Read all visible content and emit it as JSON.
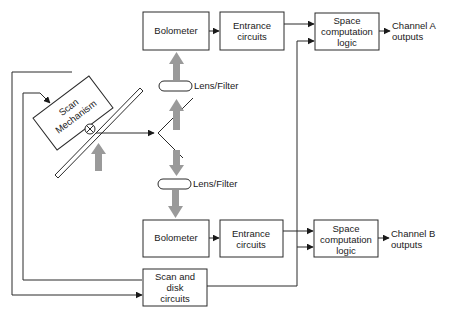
{
  "diagram": {
    "type": "block-diagram",
    "nodes": {
      "bolometer_a": {
        "label": "Bolometer"
      },
      "entrance_a": {
        "line1": "Entrance",
        "line2": "circuits"
      },
      "space_a": {
        "line1": "Space",
        "line2": "computation",
        "line3": "logic"
      },
      "output_a": {
        "line1": "Channel A",
        "line2": "outputs"
      },
      "bolometer_b": {
        "label": "Bolometer"
      },
      "entrance_b": {
        "line1": "Entrance",
        "line2": "circuits"
      },
      "space_b": {
        "line1": "Space",
        "line2": "computation",
        "line3": "logic"
      },
      "output_b": {
        "line1": "Channel B",
        "line2": "outputs"
      },
      "scan_mechanism": {
        "line1": "Scan",
        "line2": "Mechanism"
      },
      "scan_disk": {
        "line1": "Scan and",
        "line2": "disk",
        "line3": "circuits"
      },
      "lens_top": {
        "label": "Lens/Filter"
      },
      "lens_bottom": {
        "label": "Lens/Filter"
      }
    },
    "edges": [
      {
        "from": "bolometer_a",
        "to": "entrance_a"
      },
      {
        "from": "entrance_a",
        "to": "space_a"
      },
      {
        "from": "scan_disk",
        "to": "space_a"
      },
      {
        "from": "space_a",
        "to": "output_a"
      },
      {
        "from": "bolometer_b",
        "to": "entrance_b"
      },
      {
        "from": "entrance_b",
        "to": "space_b"
      },
      {
        "from": "scan_disk",
        "to": "space_b"
      },
      {
        "from": "space_b",
        "to": "output_b"
      },
      {
        "from": "scan_disk",
        "to": "scan_mechanism"
      },
      {
        "from": "scan_mechanism",
        "to": "scan_disk"
      },
      {
        "from": "scan_mirror",
        "to": "split_mirror"
      },
      {
        "from": "split_mirror",
        "to": "lens_top"
      },
      {
        "from": "lens_top",
        "to": "bolometer_a"
      },
      {
        "from": "split_mirror",
        "to": "lens_bottom"
      },
      {
        "from": "lens_bottom",
        "to": "bolometer_b"
      }
    ],
    "colors": {
      "line": "#2a2a2a",
      "beam": "#9a9a9a",
      "background": "#ffffff"
    }
  }
}
